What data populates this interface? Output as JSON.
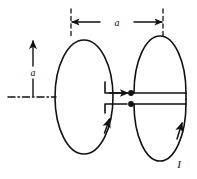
{
  "figure": {
    "kind": "technical-line-drawing",
    "background_color": "#ffffff",
    "ink_color": "#111111",
    "stroke_width": 1.6
  },
  "labels": {
    "horizontal_dimension": "a",
    "vertical_dimension": "a",
    "current": "I"
  },
  "annotations": {
    "horizontal_dimension": {
      "name": "loop-separation",
      "value": "a",
      "arrow_style": "double-headed",
      "extension_lines": "dashed",
      "x_start": 71,
      "x_end": 163,
      "y": 22
    },
    "vertical_dimension": {
      "name": "loop-height",
      "value": "a",
      "arrow_style": "single-headed-up",
      "x": 33,
      "y_top": 40,
      "y_bottom": 97
    },
    "centerline": {
      "name": "axis-centerline",
      "style": "dash-dot",
      "y": 97,
      "x_start": 8,
      "x_end": 56
    },
    "current_label": {
      "name": "current-label",
      "value": "I",
      "x": 179,
      "y": 164
    }
  },
  "elements": {
    "left_loop": {
      "name": "left-current-loop",
      "shape": "ellipse",
      "cx": 84,
      "cy": 97,
      "rx": 29,
      "ry": 57,
      "current_arrow": "upward-on-right-edge"
    },
    "right_loop": {
      "name": "right-current-loop",
      "shape": "ellipse-split-by-feedline",
      "cx": 160,
      "cy": 97,
      "rx": 26,
      "ry": 57,
      "current_arrow": "upward-on-right-edge"
    },
    "feed_line": {
      "name": "twin-lead-feedline",
      "upper_lead_y": 93,
      "lower_lead_y": 104,
      "terminal_dots": 2,
      "arrow": "rightward-on-upper-lead"
    }
  }
}
